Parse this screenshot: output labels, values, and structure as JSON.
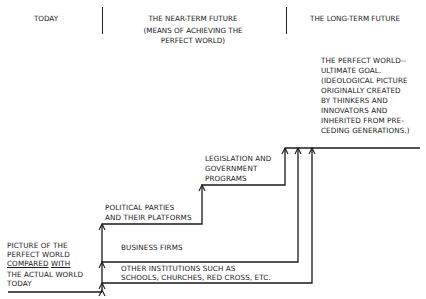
{
  "header": {
    "columns": [
      {
        "title": "TODAY",
        "subtitle": ""
      },
      {
        "title": "THE NEAR-TERM FUTURE",
        "subtitle_lines": [
          "(MEANS OF ACHIEVING THE",
          "PERFECT WORLD)"
        ]
      },
      {
        "title": "THE LONG-TERM FUTURE",
        "subtitle": ""
      }
    ]
  },
  "goal": {
    "lines": [
      "THE PERFECT WORLD--",
      "ULTIMATE GOAL.",
      "(IDEOLOGICAL PICTURE",
      "ORIGINALLY CREATED",
      "BY THINKERS AND",
      "INNOVATORS AND",
      "INHERITED FROM PRE-",
      "CEDING GENERATIONS.)"
    ]
  },
  "start": {
    "lines": [
      "PICTURE OF THE",
      "PERFECT WORLD"
    ],
    "underlined_word_1": "COMPARED",
    "underlined_word_2": "WITH",
    "lines_after": [
      "THE ACTUAL WORLD",
      "TODAY"
    ]
  },
  "steps": [
    {
      "id": "legislation",
      "lines": [
        "LEGISLATION AND",
        "GOVERNMENT",
        "PROGRAMS"
      ]
    },
    {
      "id": "political",
      "lines": [
        "POLITICAL PARTIES",
        "AND THEIR PLATFORMS"
      ]
    },
    {
      "id": "business",
      "lines": [
        "BUSINESS FIRMS"
      ]
    },
    {
      "id": "institutions",
      "lines": [
        "OTHER INSTITUTIONS SUCH AS",
        "SCHOOLS, CHURCHES, RED CROSS, ETC."
      ]
    }
  ],
  "colors": {
    "ink": "#1a1a1a",
    "background": "#ffffff"
  }
}
